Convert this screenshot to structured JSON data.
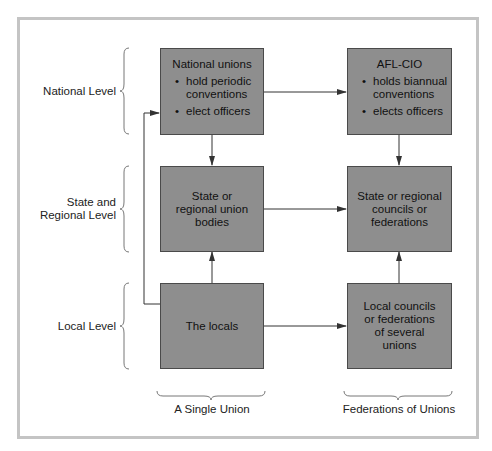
{
  "diagram": {
    "levels": [
      {
        "label": "National Level"
      },
      {
        "label_line1": "State and",
        "label_line2": "Regional Level"
      },
      {
        "label": "Local Level"
      }
    ],
    "columns": [
      {
        "label": "A Single Union"
      },
      {
        "label": "Federations of Unions"
      }
    ],
    "boxes": {
      "national_unions": {
        "title": "National unions",
        "bullets": [
          "hold periodic conventions",
          "elect officers"
        ]
      },
      "afl_cio": {
        "title": "AFL-CIO",
        "bullets": [
          "holds biannual conventions",
          "elects officers"
        ]
      },
      "state_union_bodies": {
        "lines": [
          "State or",
          "regional union",
          "bodies"
        ]
      },
      "state_councils": {
        "lines": [
          "State or regional",
          "councils or",
          "federations"
        ]
      },
      "locals": {
        "lines": [
          "The locals"
        ]
      },
      "local_councils": {
        "lines": [
          "Local councils",
          "or federations",
          "of several",
          "unions"
        ]
      }
    },
    "colors": {
      "box_fill": "#8e8e8e",
      "box_border": "#4a4a4a",
      "frame": "#c4c4c4",
      "lines": "#333333"
    }
  }
}
